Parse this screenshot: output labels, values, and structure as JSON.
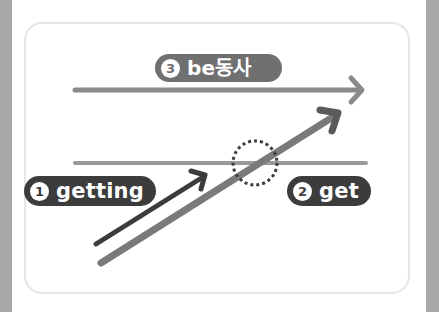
{
  "diagram": {
    "type": "tense-timeline",
    "badges": [
      {
        "number": "3",
        "label": "be동사",
        "color": "#707070"
      },
      {
        "number": "1",
        "label": "getting",
        "color": "#3c3c3c"
      },
      {
        "number": "2",
        "label": "get",
        "color": "#3c3c3c"
      }
    ],
    "lines": {
      "top_arrow_color": "#8a8a8a",
      "middle_line_color": "#9a9a9a",
      "dark_arrow_color": "#3c3c3c",
      "diagonal_arrow_color": "#7a7a7a",
      "marker_color": "#3c3c3c"
    },
    "highlight": "dotted-circle-at-intersection"
  }
}
